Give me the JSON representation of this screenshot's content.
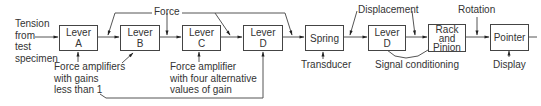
{
  "diagram": {
    "input_label": [
      "Tension",
      "from",
      "test",
      "specimen"
    ],
    "blocks": [
      {
        "id": "lever-a",
        "lines": [
          "Lever",
          "A"
        ]
      },
      {
        "id": "lever-b",
        "lines": [
          "Lever",
          "B"
        ]
      },
      {
        "id": "lever-c",
        "lines": [
          "Lever",
          "C"
        ]
      },
      {
        "id": "lever-d",
        "lines": [
          "Lever",
          "D"
        ]
      },
      {
        "id": "spring",
        "lines": [
          "Spring"
        ]
      },
      {
        "id": "lever-d2",
        "lines": [
          "Lever",
          "D"
        ]
      },
      {
        "id": "rack-pinion",
        "lines": [
          "Rack",
          "and",
          "Pinion"
        ]
      },
      {
        "id": "pointer",
        "lines": [
          "Pointer"
        ]
      }
    ],
    "signal_labels": {
      "force": "Force",
      "displacement": "Displacement",
      "rotation": "Rotation"
    },
    "annotations": {
      "force_amplifiers": [
        "Force amplifiers",
        "with gains",
        "less than 1"
      ],
      "force_amplifier_c": [
        "Force amplifier",
        "with four alternative",
        "values of gain"
      ],
      "transducer": "Transducer",
      "signal_conditioning": "Signal conditioning",
      "display": "Display"
    }
  }
}
